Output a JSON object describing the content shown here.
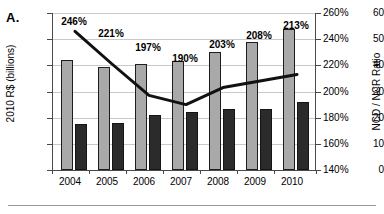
{
  "panel": {
    "label": "A."
  },
  "chart_data": {
    "type": "bar",
    "title": "",
    "subtitle": "",
    "xlabel": "",
    "ylabel": "2010 R$ (billions)",
    "y2label": "NCD / NCR Ratio",
    "categories": [
      "2004",
      "2005",
      "2006",
      "2007",
      "2008",
      "2009",
      "2010"
    ],
    "ylim": [
      0,
      60
    ],
    "yticks": [
      0,
      10,
      20,
      30,
      40,
      50,
      60
    ],
    "ytick_labels": [
      "0",
      "10",
      "20",
      "30",
      "40",
      "50",
      "60"
    ],
    "y2lim": [
      140,
      260
    ],
    "y2ticks": [
      140,
      160,
      180,
      200,
      220,
      240,
      260
    ],
    "y2tick_labels": [
      "140%",
      "160%",
      "180%",
      "200%",
      "220%",
      "240%",
      "260%"
    ],
    "grid": true,
    "legend": "none",
    "series": [
      {
        "name": "NCD",
        "type": "bar",
        "axis": "left",
        "color": "#a9a9a9",
        "values": [
          42.0,
          39.5,
          40.5,
          41.5,
          45.0,
          49.0,
          54.0
        ]
      },
      {
        "name": "NCR",
        "type": "bar",
        "axis": "left",
        "color": "#2b2b2b",
        "values": [
          17.5,
          18.0,
          21.0,
          22.0,
          23.5,
          23.5,
          26.0
        ]
      },
      {
        "name": "NCD / NCR Ratio",
        "type": "line",
        "axis": "right",
        "color": "#111111",
        "values": [
          246,
          221,
          197,
          190,
          203,
          208,
          213
        ],
        "data_labels": [
          "246%",
          "221%",
          "197%",
          "190%",
          "203%",
          "208%",
          "213%"
        ]
      }
    ]
  },
  "colors": {
    "bar_gray": "#a9a9a9",
    "bar_dark": "#2b2b2b",
    "line": "#111111",
    "grid": "#c9c9c9",
    "axis": "#4a4a4a"
  }
}
